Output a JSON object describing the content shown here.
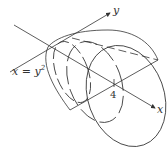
{
  "diagram": {
    "type": "solid-of-revolution",
    "labels": {
      "y_axis": "y",
      "x_axis": "x",
      "curve": "x = y",
      "curve_exponent": "2",
      "tick": "4"
    },
    "colors": {
      "stroke": "#333333",
      "background": "#ffffff"
    }
  }
}
